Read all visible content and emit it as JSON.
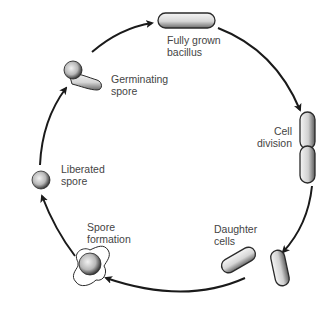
{
  "stages": [
    {
      "id": "fully-grown",
      "lines": [
        "Fully grown",
        "bacillus"
      ]
    },
    {
      "id": "cell-division",
      "lines": [
        "Cell",
        "division"
      ]
    },
    {
      "id": "daughter-cells",
      "lines": [
        "Daughter",
        "cells"
      ]
    },
    {
      "id": "spore-formation",
      "lines": [
        "Spore",
        "formation"
      ]
    },
    {
      "id": "liberated-spore",
      "lines": [
        "Liberated",
        "spore"
      ]
    },
    {
      "id": "germinating-spore",
      "lines": [
        "Germinating",
        "spore"
      ]
    }
  ],
  "colors": {
    "line": "#1a1a1a",
    "cell_fill": "#e8e8e8",
    "cell_shade": "#555555",
    "text": "#444444"
  }
}
